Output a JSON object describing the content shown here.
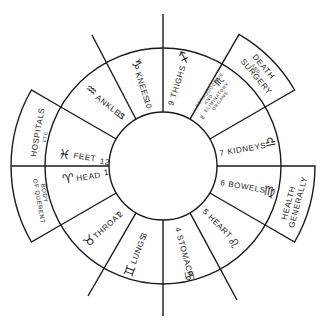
{
  "diagram": {
    "type": "astrological-house-wheel",
    "center": [
      163,
      166
    ],
    "inner_radius": 54,
    "outer_radius": 118,
    "houses": [
      {
        "number": "1",
        "body_part": "HEAD",
        "sign": "♈",
        "sign_name": "Aries"
      },
      {
        "number": "2",
        "body_part": "THROAT",
        "sign": "♉",
        "sign_name": "Taurus"
      },
      {
        "number": "3",
        "body_part": "LUNGS",
        "sign": "♊",
        "sign_name": "Gemini"
      },
      {
        "number": "4",
        "body_part": "STOMACH",
        "sign": "♋",
        "sign_name": "Cancer"
      },
      {
        "number": "5",
        "body_part": "HEART",
        "sign": "♌",
        "sign_name": "Leo"
      },
      {
        "number": "6",
        "body_part": "BOWELS",
        "sign": "♍",
        "sign_name": "Virgo"
      },
      {
        "number": "7",
        "body_part": "KIDNEYS",
        "sign": "♎",
        "sign_name": "Libra"
      },
      {
        "number": "8",
        "body_part_lines": [
          "REPRODUCTIVE",
          "AND",
          "ELIMINATORY",
          "ORGANS"
        ],
        "sign": "♏",
        "sign_name": "Scorpio"
      },
      {
        "number": "9",
        "body_part": "THIGHS",
        "sign": "♐",
        "sign_name": "Sagittarius"
      },
      {
        "number": "10",
        "body_part": "KNEES",
        "sign": "♑",
        "sign_name": "Capricorn"
      },
      {
        "number": "11",
        "body_part": "ANKLES",
        "sign": "♒",
        "sign_name": "Aquarius"
      },
      {
        "number": "12",
        "body_part": "FEET",
        "sign": "♓",
        "sign_name": "Pisces"
      }
    ],
    "tabs": {
      "hospitals": {
        "line1": "HOSPITALS",
        "line2": "ETC"
      },
      "body_of_querent": {
        "line1": "BODY",
        "line2": "OF QUERENT"
      },
      "death_surgery": {
        "line1": "DEATH",
        "line2": "AND",
        "line3": "SURGERY"
      },
      "health": {
        "line1": "HEALTH",
        "line2": "GENERALLY"
      }
    }
  }
}
